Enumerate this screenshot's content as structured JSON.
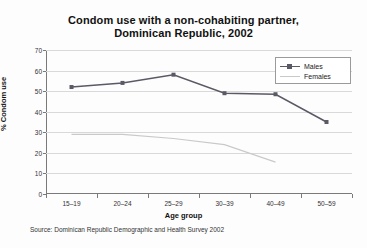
{
  "title": {
    "line1": "Condom use with a non-cohabiting partner,",
    "line2": "Dominican Republic, 2002"
  },
  "source_note": "Source: Dominican Republic Demographic and Health Survey 2002",
  "legend": {
    "position": "top-right",
    "entries": [
      {
        "label": "Males",
        "color": "#5a5a66",
        "marker": "square"
      },
      {
        "label": "Females",
        "color": "#c9c9c9",
        "marker": "none"
      }
    ]
  },
  "axes": {
    "y": {
      "label": "% Condom use",
      "min": 0,
      "max": 70,
      "step": 10,
      "ticks": [
        "0",
        "10",
        "20",
        "30",
        "40",
        "50",
        "60",
        "70"
      ]
    },
    "x": {
      "label": "Age group",
      "ticks": [
        "15–19",
        "20–24",
        "25–29",
        "30–39",
        "40–49",
        "50–59"
      ]
    }
  },
  "chart_data": {
    "type": "line",
    "title": "Condom use with a non-cohabiting partner, Dominican Republic, 2002",
    "xlabel": "Age group",
    "ylabel": "% Condom use",
    "categories": [
      "15–19",
      "20–24",
      "25–29",
      "30–39",
      "40–49",
      "50–59"
    ],
    "ylim": [
      0,
      70
    ],
    "ytick_step": 10,
    "grid": true,
    "legend_position": "top-right",
    "series": [
      {
        "name": "Males",
        "color": "#5a5a66",
        "marker": "square",
        "values": [
          52,
          54,
          58,
          49,
          48.5,
          35
        ]
      },
      {
        "name": "Females",
        "color": "#c9c9c9",
        "marker": "none",
        "values": [
          29,
          29,
          27,
          24,
          15.5,
          null
        ]
      }
    ],
    "annotations": [
      "Source: Dominican Republic Demographic and Health Survey 2002"
    ]
  }
}
